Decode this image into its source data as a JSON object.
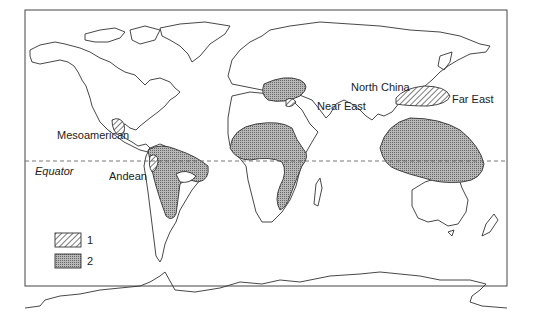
{
  "map": {
    "labels": {
      "mesoamerican": "Mesoamerican",
      "andean": "Andean",
      "near_east": "Near East",
      "north_china": "North China",
      "far_east": "Far East",
      "equator": "Equator"
    },
    "legend": [
      {
        "pattern": "hatched",
        "label": "1"
      },
      {
        "pattern": "dotted",
        "label": "2"
      }
    ],
    "colors": {
      "outline": "#333333",
      "fill_dots": "#9a9a9a",
      "background": "#ffffff"
    }
  }
}
